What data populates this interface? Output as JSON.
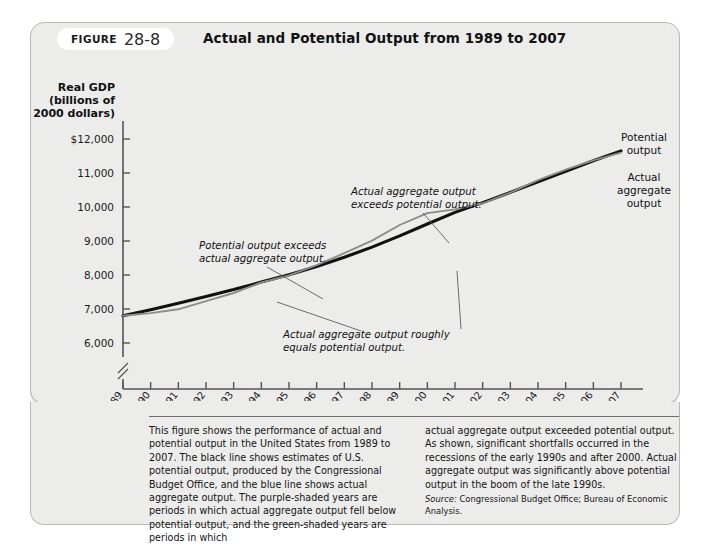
{
  "figure": {
    "label_word": "FIGURE",
    "number": "28-8",
    "title": "Actual and Potential Output from 1989 to 2007"
  },
  "chart_data": {
    "type": "line",
    "title": "Actual and Potential Output from 1989 to 2007",
    "xlabel": "Year",
    "ylabel": "Real GDP (billions of 2000 dollars)",
    "ylabel_lines": [
      "Real GDP",
      "(billions of",
      "2000 dollars)"
    ],
    "grid": false,
    "legend_position": "right-inline",
    "axis_break_y": true,
    "ylim": [
      6000,
      12000
    ],
    "ytick_labels": [
      "$12,000",
      "11,000",
      "10,000",
      "9,000",
      "8,000",
      "7,000",
      "6,000"
    ],
    "ytick_values": [
      12000,
      11000,
      10000,
      9000,
      8000,
      7000,
      6000
    ],
    "x": [
      1989,
      1990,
      1991,
      1992,
      1993,
      1994,
      1995,
      1996,
      1997,
      1998,
      1999,
      2000,
      2001,
      2002,
      2003,
      2004,
      2005,
      2006,
      2007
    ],
    "categories": [
      "1989",
      "1990",
      "1991",
      "1992",
      "1993",
      "1994",
      "1995",
      "1996",
      "1997",
      "1998",
      "1999",
      "2000",
      "2001",
      "2002",
      "2003",
      "2004",
      "2005",
      "2006",
      "2007"
    ],
    "series": [
      {
        "name": "Potential output",
        "color": "#111111",
        "values": [
          6800,
          6980,
          7170,
          7370,
          7570,
          7790,
          8010,
          8250,
          8520,
          8820,
          9150,
          9500,
          9840,
          10130,
          10430,
          10740,
          11050,
          11360,
          11650
        ]
      },
      {
        "name": "Actual aggregate output",
        "color": "#8c8c8c",
        "values": [
          6800,
          6880,
          6990,
          7230,
          7470,
          7780,
          7990,
          8290,
          8640,
          9010,
          9470,
          9820,
          9930,
          10110,
          10420,
          10790,
          11100,
          11370,
          11600
        ]
      }
    ],
    "annotations": [
      {
        "id": "potential-exceeds-actual",
        "text_lines": [
          "Potential output exceeds",
          "actual aggregate output."
        ],
        "points_to_year": 1993
      },
      {
        "id": "actual-exceeds-potential",
        "text_lines": [
          "Actual aggregate output",
          "exceeds potential output."
        ],
        "points_to_year": 2000
      },
      {
        "id": "actual-equals-potential",
        "text_lines": [
          "Actual aggregate output roughly",
          "equals potential output."
        ],
        "points_to_year": 1997
      }
    ],
    "series_labels": [
      {
        "id": "potential-output-label",
        "lines": [
          "Potential",
          "output"
        ]
      },
      {
        "id": "actual-output-label",
        "lines": [
          "Actual",
          "aggregate",
          "output"
        ]
      }
    ]
  },
  "caption": {
    "left": "This figure shows the performance of actual and potential output in the United States from 1989 to 2007. The black line shows estimates of U.S. potential output, produced by the Congressional Budget Office, and the blue line shows actual aggregate output. The purple-shaded years are periods in which actual aggregate output fell below potential output, and the green-shaded years are periods in which",
    "right": "actual aggregate output exceeded potential output. As shown, significant shortfalls occurred in the recessions of the early 1990s and after 2000. Actual aggregate output was significantly above potential output in the boom of the late 1990s.",
    "source_label": "Source:",
    "source_text": "Congressional Budget Office; Bureau of Economic Analysis."
  }
}
